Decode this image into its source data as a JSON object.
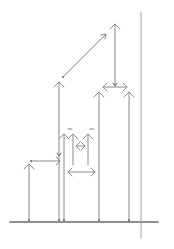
{
  "diagram": {
    "type": "arrow-line-drawing",
    "background": "#ffffff",
    "stroke_color": "#8a8a8a",
    "stroke_dark": "#6a6a6a",
    "baseline": {
      "x1": 10,
      "y1": 222,
      "x2": 158,
      "y2": 222
    },
    "reference_line": {
      "x1": 141,
      "y1": 12,
      "x2": 141,
      "y2": 238
    },
    "vertical_arrows": [
      {
        "id": "a1",
        "x": 29,
        "y_bottom": 221,
        "y_top": 164
      },
      {
        "id": "a2",
        "x": 64,
        "y_bottom": 221,
        "y_top": 134
      },
      {
        "id": "a3",
        "x": 73,
        "y_bottom": 165,
        "y_top": 134
      },
      {
        "id": "a4",
        "x": 88,
        "y_bottom": 165,
        "y_top": 134
      },
      {
        "id": "a5",
        "x": 99,
        "y_bottom": 221,
        "y_top": 92
      },
      {
        "id": "a6",
        "x": 129,
        "y_bottom": 221,
        "y_top": 92
      },
      {
        "id": "a7",
        "x": 59,
        "y_bottom": 221,
        "y_top": 82
      },
      {
        "id": "a8",
        "x": 115,
        "y_bottom": 86,
        "y_top": 24
      }
    ],
    "down_arrows": [
      {
        "id": "d1",
        "x": 59,
        "x_tip": 59,
        "y_top": 150,
        "y_bottom": 156
      },
      {
        "id": "d2",
        "x": 115,
        "y_top": 24,
        "y_bottom": 86
      }
    ],
    "horizontal_arrows": [
      {
        "id": "h1",
        "x1": 31,
        "x2": 60,
        "y": 161,
        "heads": "end"
      },
      {
        "id": "h2",
        "x1": 68,
        "x2": 95,
        "y": 172,
        "heads": "both"
      },
      {
        "id": "h3",
        "x1": 76,
        "x2": 85,
        "y": 146,
        "heads": "both"
      },
      {
        "id": "h4",
        "x1": 103,
        "x2": 127,
        "y": 87,
        "heads": "both"
      }
    ],
    "diagonal_arrows": [
      {
        "id": "g1",
        "x1": 63,
        "y1": 77,
        "x2": 106,
        "y2": 34
      }
    ],
    "tick_marks": [
      {
        "x1": 68,
        "y1": 129,
        "x2": 72,
        "y2": 129
      },
      {
        "x1": 90,
        "y1": 129,
        "x2": 94,
        "y2": 129
      }
    ]
  }
}
